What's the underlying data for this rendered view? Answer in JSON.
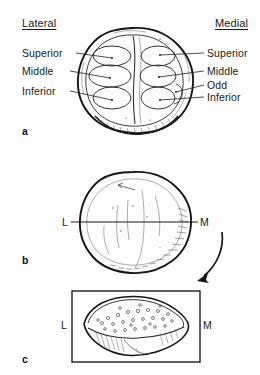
{
  "figure": {
    "background_color": "#fefefe",
    "ink_color": "#1a1a1a"
  },
  "panel_a": {
    "letter": "a",
    "header_left": "Lateral",
    "header_right": "Medial",
    "left_labels": [
      {
        "text": "Superior",
        "y": 53
      },
      {
        "text": "Middle",
        "y": 71
      },
      {
        "text": "Inferior",
        "y": 91
      }
    ],
    "right_labels": [
      {
        "text": "Superior",
        "y": 53
      },
      {
        "text": "Middle",
        "y": 71
      },
      {
        "text": "Odd",
        "y": 85
      },
      {
        "text": "Inferior",
        "y": 97
      }
    ]
  },
  "panel_b": {
    "letter": "b",
    "label_left": "L",
    "label_right": "M",
    "section_line_y": 222
  },
  "panel_c": {
    "letter": "c",
    "label_left": "L",
    "label_right": "M"
  }
}
